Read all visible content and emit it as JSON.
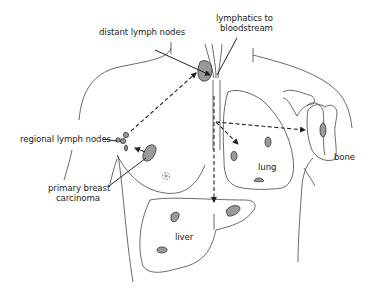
{
  "diagram": {
    "labels": {
      "distant_lymph_nodes": "distant lymph nodes",
      "lymphatics_line1": "lymphatics to",
      "lymphatics_line2": "bloodstream",
      "regional_lymph_nodes": "regional lymph nodes",
      "primary_line1": "primary breast",
      "primary_line2": "carcinoma",
      "lung": "lung",
      "bone": "bone",
      "liver": "liver"
    },
    "colors": {
      "outline": "#333333",
      "lesion_fill": "#999999",
      "arrow": "#222222",
      "background": "#ffffff"
    },
    "pathways": [
      {
        "from": "regional lymph nodes",
        "to": "distant lymph nodes",
        "style": "dashed"
      },
      {
        "from": "lymphatics to bloodstream",
        "to": "lung",
        "style": "dashed"
      },
      {
        "from": "lymphatics to bloodstream",
        "to": "bone",
        "style": "dashed"
      },
      {
        "from": "lymphatics to bloodstream",
        "to": "liver",
        "style": "dashed"
      },
      {
        "from": "primary breast carcinoma",
        "to": "regional lymph nodes",
        "style": "solid"
      }
    ]
  }
}
